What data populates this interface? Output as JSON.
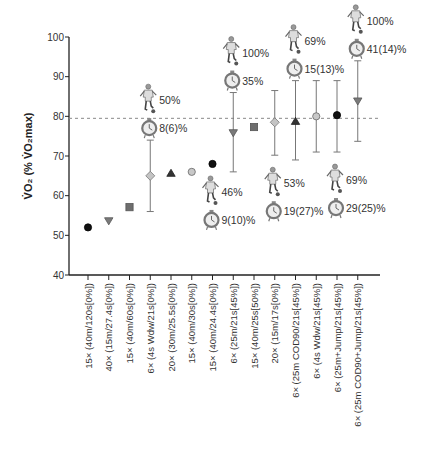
{
  "chart_data": {
    "type": "scatter",
    "title": "",
    "xlabel": "",
    "ylabel": "V̇O₂ (% V̇O₂max)",
    "ylim": [
      40,
      100
    ],
    "yticks": [
      40,
      50,
      60,
      70,
      80,
      90,
      100
    ],
    "grid": false,
    "reference_line": {
      "y": 79.5,
      "style": "dashed"
    },
    "categories": [
      "15× (40m/120s[0%])",
      "40× (15m/27.4s[0%])",
      "15× (40m/60s[0%])",
      "6× (4s Wdw/21s[0%])",
      "20× (30m/25.5s[0%])",
      "15× (40m/30s[0%])",
      "15× (40m/24.4s[0%])",
      "6× (25m/21s[45%])",
      "15× (40m/25s[50%])",
      "20× (15m/17s[0%])",
      "6× (25m COD90/21s[45%])",
      "6× (4s Wdw/21s[45%])",
      "6× (25m+Jump/21s[45%])",
      "6× (25m COD90+Jump/21s[45%])"
    ],
    "points": [
      {
        "mean": 52.0,
        "err_low": null,
        "err_high": null,
        "marker": "circle",
        "color": "#111111"
      },
      {
        "mean": 53.6,
        "err_low": null,
        "err_high": null,
        "marker": "triangle-down",
        "color": "#7a7a7a"
      },
      {
        "mean": 57.1,
        "err_low": null,
        "err_high": null,
        "marker": "square",
        "color": "#6e6e6e"
      },
      {
        "mean": 65.0,
        "err_low": 56.0,
        "err_high": 74.0,
        "marker": "diamond",
        "color": "#c4c4c4"
      },
      {
        "mean": 65.7,
        "err_low": null,
        "err_high": null,
        "marker": "triangle-up",
        "color": "#333333"
      },
      {
        "mean": 66.0,
        "err_low": null,
        "err_high": null,
        "marker": "circle",
        "color": "#c8c8c8"
      },
      {
        "mean": 68.0,
        "err_low": null,
        "err_high": null,
        "marker": "circle",
        "color": "#111111"
      },
      {
        "mean": 75.8,
        "err_low": 66.0,
        "err_high": 86.0,
        "marker": "triangle-down",
        "color": "#7a7a7a"
      },
      {
        "mean": 77.3,
        "err_low": null,
        "err_high": null,
        "marker": "square",
        "color": "#6e6e6e"
      },
      {
        "mean": 78.5,
        "err_low": 70.2,
        "err_high": 86.5,
        "marker": "diamond",
        "color": "#c4c4c4"
      },
      {
        "mean": 78.8,
        "err_low": 69.0,
        "err_high": 89.0,
        "marker": "triangle-up",
        "color": "#333333"
      },
      {
        "mean": 80.0,
        "err_low": 71.0,
        "err_high": 89.0,
        "marker": "circle",
        "color": "#c8c8c8"
      },
      {
        "mean": 80.3,
        "err_low": 71.0,
        "err_high": 89.0,
        "marker": "circle",
        "color": "#111111"
      },
      {
        "mean": 83.8,
        "err_low": 73.7,
        "err_high": 94.0,
        "marker": "triangle-down",
        "color": "#7a7a7a"
      }
    ],
    "annotations": [
      {
        "category_index": 3,
        "position": "above",
        "player_text": "50%",
        "watch_text": "8(6)%"
      },
      {
        "category_index": 6,
        "position": "below",
        "player_text": "46%",
        "watch_text": "9(10)%"
      },
      {
        "category_index": 7,
        "position": "above",
        "player_text": "100%",
        "watch_text": "35%"
      },
      {
        "category_index": 9,
        "position": "below",
        "player_text": "53%",
        "watch_text": "19(27)%"
      },
      {
        "category_index": 10,
        "position": "above",
        "player_text": "69%",
        "watch_text": "15(13)%"
      },
      {
        "category_index": 12,
        "position": "below",
        "player_text": "69%",
        "watch_text": "29(25)%"
      },
      {
        "category_index": 13,
        "position": "above",
        "player_text": "100%",
        "watch_text": "41(14)%"
      }
    ],
    "icons": {
      "player": "soccer-player-icon",
      "watch": "stopwatch-icon"
    }
  }
}
